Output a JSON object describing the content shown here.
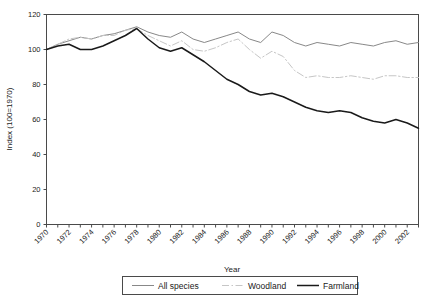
{
  "chart_data": {
    "type": "line",
    "title": "",
    "xlabel": "Year",
    "ylabel": "Index (100=1970)",
    "xlim": [
      1970,
      2003
    ],
    "ylim": [
      0,
      120
    ],
    "ytick_step": 20,
    "xtick_step": 2,
    "grid": false,
    "legend_position": "bottom",
    "ytick_labels": [
      "0",
      "20",
      "40",
      "60",
      "80",
      "100",
      "120"
    ],
    "xtick_labels": [
      "1970",
      "1972",
      "1974",
      "1976",
      "1978",
      "1980",
      "1982",
      "1984",
      "1986",
      "1988",
      "1990",
      "1992",
      "1994",
      "1996",
      "1998",
      "2000",
      "2002"
    ],
    "x": [
      1970,
      1971,
      1972,
      1973,
      1974,
      1975,
      1976,
      1977,
      1978,
      1979,
      1980,
      1981,
      1982,
      1983,
      1984,
      1985,
      1986,
      1987,
      1988,
      1989,
      1990,
      1991,
      1992,
      1993,
      1994,
      1995,
      1996,
      1997,
      1998,
      1999,
      2000,
      2001,
      2002,
      2003
    ],
    "series": [
      {
        "name": "All species",
        "style": "solid",
        "color": "#888888",
        "values": [
          100,
          103,
          105,
          107,
          106,
          108,
          109,
          111,
          113,
          110,
          108,
          107,
          110,
          106,
          104,
          106,
          108,
          110,
          106,
          104,
          110,
          108,
          104,
          102,
          104,
          103,
          102,
          104,
          103,
          102,
          104,
          105,
          103,
          104
        ]
      },
      {
        "name": "Woodland",
        "style": "dash-dot",
        "color": "#c6c6c6",
        "values": [
          100,
          103,
          106,
          107,
          106,
          108,
          108,
          111,
          112,
          108,
          105,
          102,
          105,
          100,
          99,
          101,
          104,
          106,
          100,
          95,
          99,
          96,
          88,
          84,
          85,
          84,
          84,
          85,
          84,
          83,
          85,
          85,
          84,
          84
        ]
      },
      {
        "name": "Farmland",
        "style": "solid",
        "color": "#1a1a1a",
        "values": [
          100,
          102,
          103,
          100,
          100,
          102,
          105,
          108,
          112,
          106,
          101,
          99,
          101,
          97,
          93,
          88,
          83,
          80,
          76,
          74,
          75,
          73,
          70,
          67,
          65,
          64,
          65,
          64,
          61,
          59,
          58,
          60,
          58,
          55
        ]
      }
    ]
  },
  "legend": {
    "items": [
      {
        "label": "All species"
      },
      {
        "label": "Woodland"
      },
      {
        "label": "Farmland"
      }
    ]
  }
}
